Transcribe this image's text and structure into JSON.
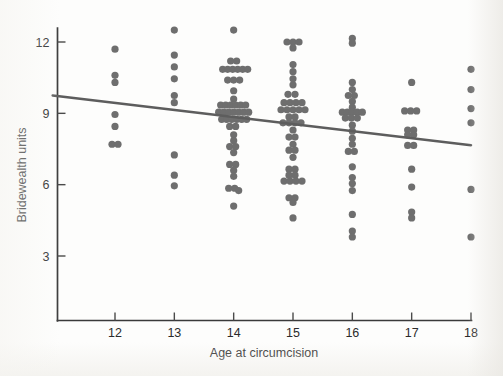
{
  "figure": {
    "background_color": "#fdfdfc",
    "point_color": "#6e6e6e",
    "line_color": "#5d5d5d",
    "axis_color": "#3a3a3a"
  },
  "chart_data": {
    "type": "scatter",
    "title": "",
    "xlabel": "Age at circumcision",
    "ylabel": "Bridewealth units",
    "xlim": [
      10.95,
      18.0
    ],
    "ylim": [
      1.45,
      13.05
    ],
    "xticks": [
      12,
      13,
      14,
      15,
      16,
      17,
      18
    ],
    "xtick_labels": [
      "12",
      "13",
      "14",
      "15",
      "16",
      "17",
      "18"
    ],
    "yticks": [
      3,
      6,
      9,
      12
    ],
    "ytick_labels": [
      "3",
      "6",
      "9",
      "12"
    ],
    "grid": false,
    "legend": null,
    "marker": "circle",
    "marker_size_px": 5.2,
    "jitter": "horizontal",
    "trend_line": {
      "type": "linear-fit",
      "x_start": 10.95,
      "y_start": 9.75,
      "x_end": 18.0,
      "y_end": 7.66,
      "slope": -0.296,
      "intercept": 12.99
    },
    "series": [
      {
        "name": "Bridewealth by age at circumcision",
        "points": [
          {
            "x": 12,
            "y": 11.7,
            "jx": 0
          },
          {
            "x": 12,
            "y": 10.6,
            "jx": 0
          },
          {
            "x": 12,
            "y": 10.3,
            "jx": 0
          },
          {
            "x": 12,
            "y": 8.95,
            "jx": 0
          },
          {
            "x": 12,
            "y": 8.45,
            "jx": 0
          },
          {
            "x": 12,
            "y": 7.7,
            "jx": -3
          },
          {
            "x": 12,
            "y": 7.7,
            "jx": 3
          },
          {
            "x": 13,
            "y": 12.5,
            "jx": 0
          },
          {
            "x": 13,
            "y": 11.45,
            "jx": 0
          },
          {
            "x": 13,
            "y": 10.95,
            "jx": 0
          },
          {
            "x": 13,
            "y": 10.45,
            "jx": 0
          },
          {
            "x": 13,
            "y": 9.75,
            "jx": 0
          },
          {
            "x": 13,
            "y": 9.45,
            "jx": 0
          },
          {
            "x": 13,
            "y": 7.25,
            "jx": 0
          },
          {
            "x": 13,
            "y": 6.4,
            "jx": 0
          },
          {
            "x": 13,
            "y": 5.95,
            "jx": 0
          },
          {
            "x": 14,
            "y": 12.5,
            "jx": 0
          },
          {
            "x": 14,
            "y": 11.2,
            "jx": -3
          },
          {
            "x": 14,
            "y": 11.2,
            "jx": 3
          },
          {
            "x": 14,
            "y": 10.85,
            "jx": -11
          },
          {
            "x": 14,
            "y": 10.85,
            "jx": -6
          },
          {
            "x": 14,
            "y": 10.85,
            "jx": -1
          },
          {
            "x": 14,
            "y": 10.85,
            "jx": 4
          },
          {
            "x": 14,
            "y": 10.85,
            "jx": 9
          },
          {
            "x": 14,
            "y": 10.85,
            "jx": 14
          },
          {
            "x": 14,
            "y": 10.4,
            "jx": -6
          },
          {
            "x": 14,
            "y": 10.4,
            "jx": 0
          },
          {
            "x": 14,
            "y": 10.4,
            "jx": 6
          },
          {
            "x": 14,
            "y": 9.95,
            "jx": 0
          },
          {
            "x": 14,
            "y": 9.6,
            "jx": 0
          },
          {
            "x": 14,
            "y": 9.35,
            "jx": -13
          },
          {
            "x": 14,
            "y": 9.35,
            "jx": -8
          },
          {
            "x": 14,
            "y": 9.35,
            "jx": -3
          },
          {
            "x": 14,
            "y": 9.35,
            "jx": 2
          },
          {
            "x": 14,
            "y": 9.35,
            "jx": 7
          },
          {
            "x": 14,
            "y": 9.35,
            "jx": 12
          },
          {
            "x": 14,
            "y": 9.05,
            "jx": -15
          },
          {
            "x": 14,
            "y": 9.05,
            "jx": -10
          },
          {
            "x": 14,
            "y": 9.05,
            "jx": -5
          },
          {
            "x": 14,
            "y": 9.05,
            "jx": 0
          },
          {
            "x": 14,
            "y": 9.05,
            "jx": 5
          },
          {
            "x": 14,
            "y": 9.05,
            "jx": 10
          },
          {
            "x": 14,
            "y": 9.05,
            "jx": 15
          },
          {
            "x": 14,
            "y": 8.75,
            "jx": -12
          },
          {
            "x": 14,
            "y": 8.75,
            "jx": -7
          },
          {
            "x": 14,
            "y": 8.75,
            "jx": -2
          },
          {
            "x": 14,
            "y": 8.75,
            "jx": 3
          },
          {
            "x": 14,
            "y": 8.75,
            "jx": 8
          },
          {
            "x": 14,
            "y": 8.75,
            "jx": 13
          },
          {
            "x": 14,
            "y": 8.45,
            "jx": -4
          },
          {
            "x": 14,
            "y": 8.45,
            "jx": 2
          },
          {
            "x": 14,
            "y": 8.1,
            "jx": 0
          },
          {
            "x": 14,
            "y": 7.85,
            "jx": 0
          },
          {
            "x": 14,
            "y": 7.6,
            "jx": -4
          },
          {
            "x": 14,
            "y": 7.6,
            "jx": 2
          },
          {
            "x": 14,
            "y": 7.35,
            "jx": 0
          },
          {
            "x": 14,
            "y": 6.85,
            "jx": -4
          },
          {
            "x": 14,
            "y": 6.85,
            "jx": 2
          },
          {
            "x": 14,
            "y": 6.6,
            "jx": 0
          },
          {
            "x": 14,
            "y": 6.35,
            "jx": 0
          },
          {
            "x": 14,
            "y": 5.85,
            "jx": -5
          },
          {
            "x": 14,
            "y": 5.85,
            "jx": 1
          },
          {
            "x": 14,
            "y": 5.75,
            "jx": 5
          },
          {
            "x": 14,
            "y": 5.1,
            "jx": 0
          },
          {
            "x": 15,
            "y": 12.0,
            "jx": -6
          },
          {
            "x": 15,
            "y": 12.0,
            "jx": 0
          },
          {
            "x": 15,
            "y": 12.0,
            "jx": 6
          },
          {
            "x": 15,
            "y": 11.75,
            "jx": 0
          },
          {
            "x": 15,
            "y": 11.05,
            "jx": 0
          },
          {
            "x": 15,
            "y": 10.75,
            "jx": 0
          },
          {
            "x": 15,
            "y": 10.45,
            "jx": 0
          },
          {
            "x": 15,
            "y": 10.2,
            "jx": 0
          },
          {
            "x": 15,
            "y": 9.8,
            "jx": -5
          },
          {
            "x": 15,
            "y": 9.8,
            "jx": 2
          },
          {
            "x": 15,
            "y": 9.45,
            "jx": -9
          },
          {
            "x": 15,
            "y": 9.45,
            "jx": -3
          },
          {
            "x": 15,
            "y": 9.45,
            "jx": 3
          },
          {
            "x": 15,
            "y": 9.45,
            "jx": 9
          },
          {
            "x": 15,
            "y": 9.15,
            "jx": -12
          },
          {
            "x": 15,
            "y": 9.15,
            "jx": -6
          },
          {
            "x": 15,
            "y": 9.15,
            "jx": 0
          },
          {
            "x": 15,
            "y": 9.15,
            "jx": 6
          },
          {
            "x": 15,
            "y": 9.15,
            "jx": 12
          },
          {
            "x": 15,
            "y": 8.85,
            "jx": -4
          },
          {
            "x": 15,
            "y": 8.85,
            "jx": 2
          },
          {
            "x": 15,
            "y": 8.6,
            "jx": -10
          },
          {
            "x": 15,
            "y": 8.6,
            "jx": -4
          },
          {
            "x": 15,
            "y": 8.6,
            "jx": 2
          },
          {
            "x": 15,
            "y": 8.6,
            "jx": 8
          },
          {
            "x": 15,
            "y": 8.3,
            "jx": 0
          },
          {
            "x": 15,
            "y": 8.0,
            "jx": -4
          },
          {
            "x": 15,
            "y": 8.0,
            "jx": 2
          },
          {
            "x": 15,
            "y": 7.7,
            "jx": 0
          },
          {
            "x": 15,
            "y": 7.45,
            "jx": -4
          },
          {
            "x": 15,
            "y": 7.45,
            "jx": 2
          },
          {
            "x": 15,
            "y": 7.15,
            "jx": 0
          },
          {
            "x": 15,
            "y": 6.65,
            "jx": -4
          },
          {
            "x": 15,
            "y": 6.65,
            "jx": 2
          },
          {
            "x": 15,
            "y": 6.4,
            "jx": -4
          },
          {
            "x": 15,
            "y": 6.4,
            "jx": 2
          },
          {
            "x": 15,
            "y": 6.15,
            "jx": -9
          },
          {
            "x": 15,
            "y": 6.15,
            "jx": -3
          },
          {
            "x": 15,
            "y": 6.15,
            "jx": 3
          },
          {
            "x": 15,
            "y": 6.15,
            "jx": 9
          },
          {
            "x": 15,
            "y": 5.45,
            "jx": -4
          },
          {
            "x": 15,
            "y": 5.45,
            "jx": 2
          },
          {
            "x": 15,
            "y": 5.25,
            "jx": 0
          },
          {
            "x": 15,
            "y": 4.6,
            "jx": 0
          },
          {
            "x": 16,
            "y": 12.15,
            "jx": 0
          },
          {
            "x": 16,
            "y": 11.95,
            "jx": 0
          },
          {
            "x": 16,
            "y": 10.3,
            "jx": 0
          },
          {
            "x": 16,
            "y": 10.0,
            "jx": 0
          },
          {
            "x": 16,
            "y": 9.75,
            "jx": -4
          },
          {
            "x": 16,
            "y": 9.75,
            "jx": 2
          },
          {
            "x": 16,
            "y": 9.5,
            "jx": 0
          },
          {
            "x": 16,
            "y": 9.25,
            "jx": 0
          },
          {
            "x": 16,
            "y": 9.05,
            "jx": -10
          },
          {
            "x": 16,
            "y": 9.05,
            "jx": -5
          },
          {
            "x": 16,
            "y": 9.05,
            "jx": 0
          },
          {
            "x": 16,
            "y": 9.05,
            "jx": 5
          },
          {
            "x": 16,
            "y": 9.05,
            "jx": 10
          },
          {
            "x": 16,
            "y": 8.8,
            "jx": -7
          },
          {
            "x": 16,
            "y": 8.8,
            "jx": -1
          },
          {
            "x": 16,
            "y": 8.8,
            "jx": 5
          },
          {
            "x": 16,
            "y": 8.5,
            "jx": 0
          },
          {
            "x": 16,
            "y": 8.25,
            "jx": 0
          },
          {
            "x": 16,
            "y": 7.95,
            "jx": 0
          },
          {
            "x": 16,
            "y": 7.7,
            "jx": 0
          },
          {
            "x": 16,
            "y": 7.4,
            "jx": -4
          },
          {
            "x": 16,
            "y": 7.4,
            "jx": 2
          },
          {
            "x": 16,
            "y": 6.75,
            "jx": 0
          },
          {
            "x": 16,
            "y": 6.3,
            "jx": 0
          },
          {
            "x": 16,
            "y": 6.05,
            "jx": 0
          },
          {
            "x": 16,
            "y": 5.75,
            "jx": 0
          },
          {
            "x": 16,
            "y": 4.75,
            "jx": 0
          },
          {
            "x": 16,
            "y": 4.05,
            "jx": 0
          },
          {
            "x": 16,
            "y": 3.8,
            "jx": 0
          },
          {
            "x": 17,
            "y": 10.3,
            "jx": 0
          },
          {
            "x": 17,
            "y": 9.1,
            "jx": -7
          },
          {
            "x": 17,
            "y": 9.1,
            "jx": -1
          },
          {
            "x": 17,
            "y": 9.1,
            "jx": 5
          },
          {
            "x": 17,
            "y": 8.3,
            "jx": -4
          },
          {
            "x": 17,
            "y": 8.3,
            "jx": 2
          },
          {
            "x": 17,
            "y": 8.1,
            "jx": -4
          },
          {
            "x": 17,
            "y": 8.1,
            "jx": 2
          },
          {
            "x": 17,
            "y": 7.65,
            "jx": -4
          },
          {
            "x": 17,
            "y": 7.65,
            "jx": 2
          },
          {
            "x": 17,
            "y": 6.65,
            "jx": 0
          },
          {
            "x": 17,
            "y": 5.9,
            "jx": 0
          },
          {
            "x": 17,
            "y": 4.85,
            "jx": 0
          },
          {
            "x": 17,
            "y": 4.6,
            "jx": 0
          },
          {
            "x": 18,
            "y": 10.85,
            "jx": 0
          },
          {
            "x": 18,
            "y": 10.0,
            "jx": 0
          },
          {
            "x": 18,
            "y": 9.2,
            "jx": 0
          },
          {
            "x": 18,
            "y": 8.6,
            "jx": 0
          },
          {
            "x": 18,
            "y": 5.8,
            "jx": 0
          },
          {
            "x": 18,
            "y": 3.8,
            "jx": 0
          }
        ]
      }
    ]
  }
}
